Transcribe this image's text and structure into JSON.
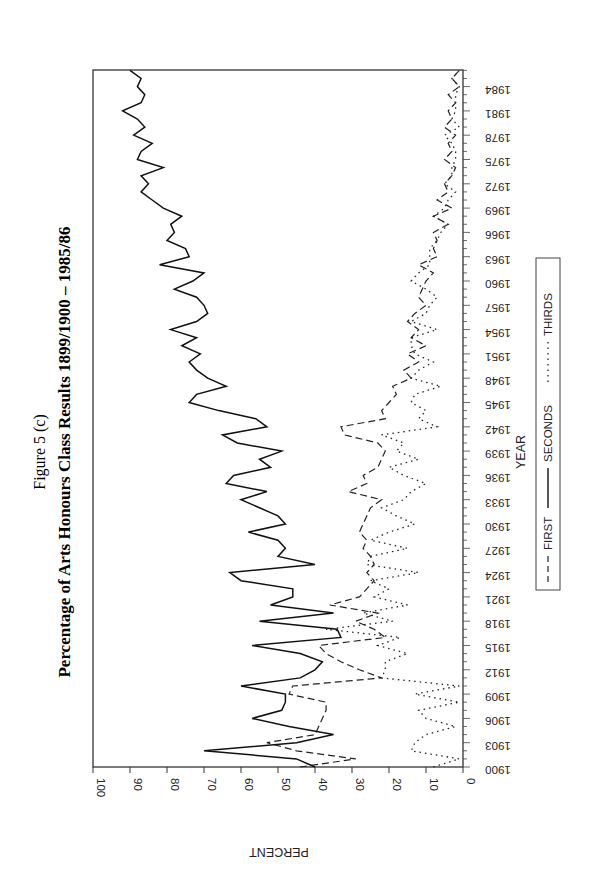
{
  "figure": {
    "label": "Figure 5 (c)",
    "title": "Percentage of Arts Honours Class Results 1899/1900 – 1985/86"
  },
  "axes": {
    "x_title": "YEAR",
    "y_title": "PERCENT",
    "y_ticks": [
      "0",
      "10",
      "20",
      "30",
      "40",
      "50",
      "60",
      "70",
      "80",
      "90",
      "100"
    ],
    "x_ticks": [
      "1900",
      "1903",
      "1906",
      "1909",
      "1912",
      "1915",
      "1918",
      "1921",
      "1924",
      "1927",
      "1930",
      "1933",
      "1936",
      "1939",
      "1942",
      "1945",
      "1948",
      "1951",
      "1954",
      "1957",
      "1960",
      "1963",
      "1966",
      "1969",
      "1972",
      "1975",
      "1978",
      "1981",
      "1984"
    ]
  },
  "legend": {
    "first": "FIRST",
    "seconds": "SECONDS",
    "thirds": "THIRDS"
  },
  "chart_data": {
    "type": "line",
    "title": "Percentage of Arts Honours Class Results 1899/1900 – 1985/86",
    "subtitle": "Figure 5 (c)",
    "xlabel": "YEAR",
    "ylabel": "PERCENT",
    "ylim": [
      0,
      100
    ],
    "xlim": [
      1900,
      1986
    ],
    "grid": false,
    "legend_position": "below (rotated)",
    "orientation": "rotated 90° clockwise on page",
    "x": [
      1900,
      1901,
      1902,
      1903,
      1904,
      1905,
      1906,
      1907,
      1908,
      1909,
      1910,
      1911,
      1912,
      1913,
      1914,
      1915,
      1916,
      1917,
      1918,
      1919,
      1920,
      1921,
      1922,
      1923,
      1924,
      1925,
      1926,
      1927,
      1928,
      1929,
      1930,
      1931,
      1932,
      1933,
      1934,
      1935,
      1936,
      1937,
      1938,
      1939,
      1940,
      1941,
      1942,
      1943,
      1944,
      1945,
      1946,
      1947,
      1948,
      1949,
      1950,
      1951,
      1952,
      1953,
      1954,
      1955,
      1956,
      1957,
      1958,
      1959,
      1960,
      1961,
      1962,
      1963,
      1964,
      1965,
      1966,
      1967,
      1968,
      1969,
      1970,
      1971,
      1972,
      1973,
      1974,
      1975,
      1976,
      1977,
      1978,
      1979,
      1980,
      1981,
      1982,
      1983,
      1984,
      1985,
      1986
    ],
    "series": [
      {
        "name": "FIRST",
        "style": "dashed",
        "values": [
          44,
          29,
          45,
          53,
          40,
          39,
          38,
          37,
          37,
          47,
          46,
          22,
          28,
          33,
          37,
          39,
          21,
          24,
          29,
          23,
          36,
          28,
          26,
          24,
          26,
          24,
          25,
          27,
          26,
          28,
          27,
          26,
          25,
          22,
          31,
          26,
          27,
          23,
          22,
          21,
          23,
          32,
          33,
          21,
          22,
          20,
          18,
          19,
          14,
          16,
          12,
          15,
          10,
          14,
          12,
          15,
          13,
          10,
          12,
          11,
          10,
          8,
          12,
          7,
          8,
          7,
          8,
          4,
          8,
          3,
          7,
          4,
          5,
          3,
          2,
          5,
          3,
          4,
          2,
          5,
          3,
          4,
          2,
          4,
          1,
          3,
          1
        ]
      },
      {
        "name": "SECONDS",
        "style": "solid",
        "values": [
          40,
          45,
          70,
          45,
          35,
          47,
          57,
          49,
          48,
          48,
          60,
          44,
          40,
          38,
          44,
          57,
          33,
          34,
          55,
          35,
          52,
          46,
          46,
          60,
          63,
          40,
          50,
          48,
          50,
          58,
          48,
          50,
          55,
          60,
          53,
          64,
          62,
          52,
          55,
          49,
          61,
          65,
          53,
          56,
          66,
          74,
          72,
          64,
          69,
          72,
          74,
          71,
          76,
          72,
          79,
          72,
          69,
          70,
          72,
          78,
          73,
          70,
          82,
          74,
          75,
          80,
          78,
          79,
          76,
          81,
          84,
          87,
          85,
          87,
          81,
          88,
          87,
          84,
          89,
          86,
          88,
          92,
          87,
          86,
          88,
          87,
          90
        ]
      },
      {
        "name": "THIRDS",
        "style": "dotted",
        "values": [
          8,
          1,
          14,
          13,
          10,
          2,
          10,
          12,
          1,
          13,
          1,
          22,
          21,
          21,
          15,
          23,
          17,
          37,
          19,
          27,
          15,
          24,
          20,
          25,
          12,
          26,
          25,
          15,
          25,
          20,
          13,
          18,
          22,
          16,
          14,
          10,
          16,
          20,
          12,
          18,
          16,
          22,
          7,
          12,
          10,
          14,
          13,
          6,
          14,
          12,
          8,
          13,
          14,
          14,
          7,
          14,
          10,
          9,
          7,
          10,
          14,
          12,
          9,
          9,
          9,
          7,
          6,
          4,
          8,
          5,
          4,
          2,
          5,
          3,
          3,
          2,
          2,
          3,
          5,
          1,
          3,
          2,
          2,
          2,
          1,
          3,
          1
        ]
      }
    ]
  }
}
